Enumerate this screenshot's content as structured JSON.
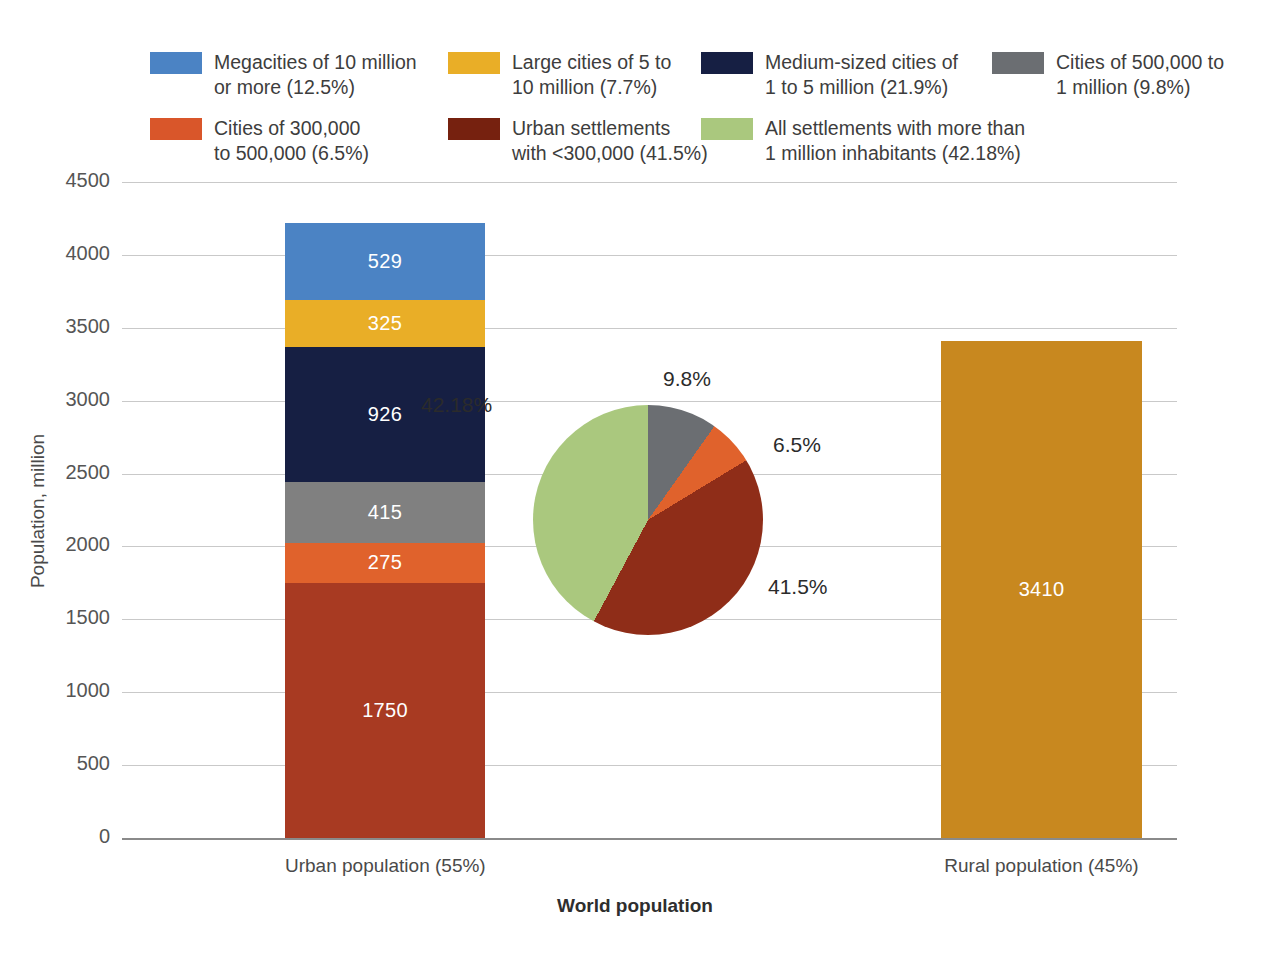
{
  "chart_data": {
    "type": "bar",
    "title": "",
    "xlabel": "World population",
    "ylabel": "Population, million",
    "ylim": [
      0,
      4500
    ],
    "yticks": [
      "0",
      "500",
      "1000",
      "1500",
      "2000",
      "2500",
      "3000",
      "3500",
      "4000",
      "4500"
    ],
    "ytick_values": [
      0,
      500,
      1000,
      1500,
      2000,
      2500,
      3000,
      3500,
      4000,
      4500
    ],
    "grid": true,
    "legend_position": "top",
    "categories": [
      "Urban population (55%)",
      "Rural population (45%)"
    ],
    "stacked_bar": {
      "category": "Urban population (55%)",
      "total": 4220,
      "segments": [
        {
          "name": "Urban settlements with <300,000",
          "value": 1750,
          "label": "1750",
          "percent": "41.5%",
          "color": "#a83a22"
        },
        {
          "name": "Cities of 300,000 to 500,000",
          "value": 275,
          "label": "275",
          "percent": "6.5%",
          "color": "#e0622c"
        },
        {
          "name": "Cities of 500,000 to 1 million",
          "value": 415,
          "label": "415",
          "percent": "9.8%",
          "color": "#808080"
        },
        {
          "name": "Medium-sized cities of 1 to 5 million",
          "value": 926,
          "label": "926",
          "percent": "21.9%",
          "color": "#161f43"
        },
        {
          "name": "Large cities of 5 to 10 million",
          "value": 325,
          "label": "325",
          "percent": "7.7%",
          "color": "#e9ae27"
        },
        {
          "name": "Megacities of 10 million or more",
          "value": 529,
          "label": "529",
          "percent": "12.5%",
          "color": "#4b83c4"
        }
      ]
    },
    "simple_bar": {
      "category": "Rural population (45%)",
      "value": 3410,
      "label": "3410",
      "color": "#c8881f"
    },
    "pie": {
      "type": "pie",
      "start_angle_deg": 0,
      "slices": [
        {
          "name": "Cities of 500,000 to 1 million",
          "value": 9.8,
          "label": "9.8%",
          "color": "#6b6e72"
        },
        {
          "name": "Cities of 300,000 to 500,000",
          "value": 6.5,
          "label": "6.5%",
          "color": "#e0622c"
        },
        {
          "name": "Urban settlements with <300,000",
          "value": 41.5,
          "label": "41.5%",
          "color": "#8f2d18"
        },
        {
          "name": "All settlements with more than 1 million inhabitants",
          "value": 42.18,
          "label": "42.18%",
          "color": "#aac87e"
        }
      ]
    },
    "legend": [
      {
        "label": "Megacities of 10 million\nor more (12.5%)",
        "color": "#4b83c4"
      },
      {
        "label": "Large cities of 5 to\n10 million (7.7%)",
        "color": "#e9ae27"
      },
      {
        "label": "Medium-sized cities of\n1 to 5 million (21.9%)",
        "color": "#161f43"
      },
      {
        "label": "Cities of 500,000 to\n1 million (9.8%)",
        "color": "#6b6e72"
      },
      {
        "label": "Cities of 300,000\nto 500,000 (6.5%)",
        "color": "#d9562a"
      },
      {
        "label": "Urban settlements\nwith <300,000 (41.5%)",
        "color": "#76210f"
      },
      {
        "label": "All settlements with more than\n1 million inhabitants (42.18%)",
        "color": "#aac87e"
      }
    ]
  }
}
